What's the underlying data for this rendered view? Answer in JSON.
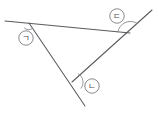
{
  "figure": {
    "background_color": "#ffffff",
    "line_color": "#5a5a5f",
    "arc_color": "#8b8b90",
    "label_color": "#4e4e54",
    "labels": [
      {
        "id": "left-angle",
        "text": "ㄱ",
        "cx": 26,
        "cy": 38,
        "r": 7.2
      },
      {
        "id": "bottom-angle",
        "text": "ㄴ",
        "cx": 92,
        "cy": 86,
        "r": 7.2
      },
      {
        "id": "right-angle",
        "text": "ㄷ",
        "cx": 117,
        "cy": 16,
        "r": 7.2
      }
    ],
    "vertices": [
      {
        "id": "vertex-left",
        "x": 29,
        "y": 23
      },
      {
        "id": "vertex-bottom",
        "x": 72,
        "y": 82
      },
      {
        "id": "vertex-right",
        "x": 130,
        "y": 33
      }
    ],
    "segments": [
      {
        "id": "top-edge",
        "x1": 5,
        "y1": 21,
        "x2": 130,
        "y2": 33
      },
      {
        "id": "left-edge",
        "x1": 29,
        "y1": 23,
        "x2": 85,
        "y2": 106
      },
      {
        "id": "right-edge",
        "x1": 72,
        "y1": 82,
        "x2": 152,
        "y2": 10
      }
    ],
    "arcs": [
      {
        "id": "arc-left",
        "d": "M 24.5 28.2 A 6.0 6.0 0 0 0 32.6 28.3"
      },
      {
        "id": "arc-bottom",
        "d": "M 78.3 73.9 A 9.4 9.4 0 0 1 81.0 88.2"
      },
      {
        "id": "arc-right",
        "d": "M 117.9 31.9 A 12.4 12.4 0 0 1 136.6 23.1"
      }
    ]
  }
}
